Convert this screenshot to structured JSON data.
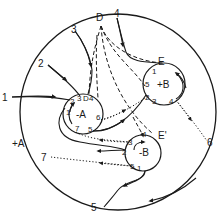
{
  "diagram": {
    "type": "flow-topology-schematic",
    "outer_boundary": {
      "labels": {
        "p1": "1",
        "p2": "2",
        "p3": "3",
        "pD": "D",
        "p4": "4",
        "p6": "6",
        "p7": "7",
        "p5": "5"
      },
      "region_label": "+A"
    },
    "circle_minus_A": {
      "center_label": "-A",
      "labels": {
        "p1": "1",
        "p2": "2",
        "p3": "3",
        "pD": "D",
        "p4": "4",
        "p6": "6",
        "p7": "7",
        "p5": "5"
      }
    },
    "circle_plus_B": {
      "center_label": "+B",
      "point_label": "E",
      "labels": {
        "p1": "1",
        "p5": "5",
        "p2": "2",
        "p3": "3",
        "p4": "4"
      }
    },
    "circle_minus_B": {
      "center_label": "-B",
      "point_label": "E'",
      "labels": {
        "p3": "3",
        "p4": "4",
        "p2": "2",
        "p5": "5",
        "p1": "1"
      }
    },
    "line_styles": {
      "solid": "trajectory",
      "dashed": "separatrix",
      "dotted": "boundary flow"
    },
    "colors": {
      "ink": "#1a1a1a",
      "background": "#ffffff"
    }
  }
}
